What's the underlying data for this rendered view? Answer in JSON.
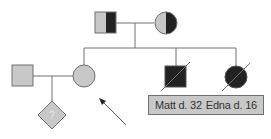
{
  "diagram": {
    "type": "pedigree",
    "colors": {
      "unaffected_fill": "#c8c8c8",
      "affected_fill": "#222222",
      "line": "#707070",
      "label_bg": "#c8c8c8"
    },
    "generation1": {
      "father": {
        "shape": "square",
        "status": "carrier-half-shaded"
      },
      "mother": {
        "shape": "circle",
        "status": "carrier-half-shaded"
      }
    },
    "generation2": [
      {
        "id": "spouse",
        "shape": "square",
        "status": "unaffected"
      },
      {
        "id": "daughter",
        "shape": "circle",
        "status": "unaffected",
        "pointed_by_arrow": true
      },
      {
        "id": "matt",
        "shape": "square",
        "status": "affected-deceased"
      },
      {
        "id": "edna",
        "shape": "circle",
        "status": "affected-deceased"
      }
    ],
    "generation3": [
      {
        "id": "unborn",
        "shape": "diamond",
        "status": "unknown",
        "symbol": "?"
      }
    ],
    "labels": {
      "matt": "Matt d. 32",
      "edna": "Edna d. 16"
    }
  }
}
